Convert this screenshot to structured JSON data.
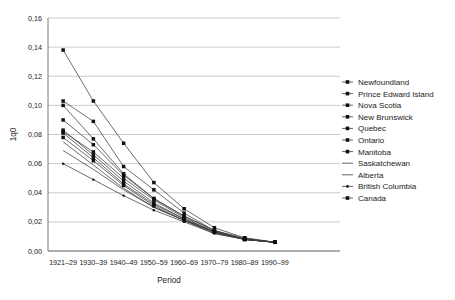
{
  "chart_data": {
    "type": "line",
    "title": "",
    "xlabel": "Period",
    "ylabel": "1q0",
    "ylim": [
      0.0,
      0.16
    ],
    "ytick_step": 0.02,
    "ytick_labels": [
      "0,00",
      "0,02",
      "0,04",
      "0,06",
      "0,08",
      "0,10",
      "0,12",
      "0,14",
      "0,16"
    ],
    "ytick_values": [
      0.0,
      0.02,
      0.04,
      0.06,
      0.08,
      0.1,
      0.12,
      0.14,
      0.16
    ],
    "decimal_separator": "comma",
    "grid": "horizontal",
    "legend_position": "right",
    "categories": [
      "1921–29",
      "1930–39",
      "1940–49",
      "1950–59",
      "1960–69",
      "1970–79",
      "1980–89",
      "1990–99"
    ],
    "series": [
      {
        "name": "Newfoundland",
        "marker": "square",
        "values": [
          0.138,
          0.103,
          0.074,
          0.047,
          0.029,
          0.016,
          0.009,
          0.006
        ]
      },
      {
        "name": "Prince Edward Island",
        "marker": "square",
        "values": [
          0.103,
          0.089,
          0.058,
          0.042,
          0.026,
          0.014,
          0.009,
          0.006
        ]
      },
      {
        "name": "Nova Scotia",
        "marker": "square",
        "values": [
          0.1,
          0.077,
          0.053,
          0.036,
          0.024,
          0.014,
          0.008,
          0.006
        ]
      },
      {
        "name": "New Brunswick",
        "marker": "square",
        "values": [
          0.09,
          0.073,
          0.052,
          0.036,
          0.024,
          0.014,
          0.008,
          0.006
        ]
      },
      {
        "name": "Quebec",
        "marker": "square",
        "values": [
          0.082,
          0.068,
          0.05,
          0.035,
          0.023,
          0.013,
          0.008,
          0.006
        ]
      },
      {
        "name": "Ontario",
        "marker": "square",
        "values": [
          0.081,
          0.064,
          0.046,
          0.032,
          0.022,
          0.013,
          0.008,
          0.006
        ]
      },
      {
        "name": "Manitoba",
        "marker": "square",
        "values": [
          0.078,
          0.062,
          0.045,
          0.031,
          0.021,
          0.013,
          0.008,
          0.006
        ]
      },
      {
        "name": "Saskatchewan",
        "marker": "none",
        "values": [
          0.075,
          0.059,
          0.043,
          0.03,
          0.021,
          0.013,
          0.008,
          0.006
        ]
      },
      {
        "name": "Alberta",
        "marker": "none",
        "values": [
          0.069,
          0.056,
          0.042,
          0.03,
          0.021,
          0.012,
          0.008,
          0.006
        ]
      },
      {
        "name": "British Columbia",
        "marker": "dot",
        "values": [
          0.06,
          0.049,
          0.038,
          0.028,
          0.02,
          0.012,
          0.008,
          0.006
        ]
      },
      {
        "name": "Canada",
        "marker": "square",
        "values": [
          0.083,
          0.066,
          0.048,
          0.033,
          0.022,
          0.013,
          0.008,
          0.006
        ]
      }
    ]
  },
  "colors": {
    "background": "#ffffff",
    "gridline": "#b4b4b4",
    "axis": "#5a5a5a",
    "line": "#3c3c3c",
    "marker": "#111111",
    "text": "#1a1a1a"
  }
}
